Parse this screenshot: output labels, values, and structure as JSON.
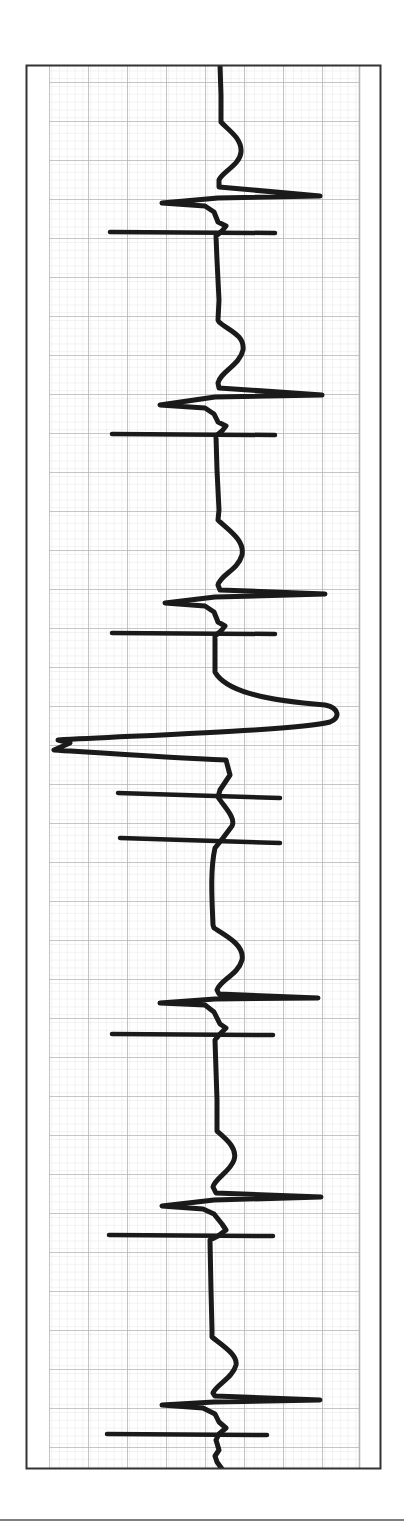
{
  "chart_data": {
    "type": "line",
    "title": "",
    "description": "Rhythm strip (rotated 90 degrees, time runs top to bottom) on ECG grid paper showing paced-style narrow complexes with pacing spike lines, and one wide ectopic complex",
    "orientation": "vertical-time",
    "xlabel": "",
    "ylabel": "",
    "grid": true,
    "grid_major_px": 39,
    "grid_minor_px": 7.8,
    "colors": {
      "trace": "#1a1a1a",
      "grid_major": "#b4b4b4",
      "grid_minor": "#dcdcdc",
      "frame": "#333333",
      "paper": "#ffffff"
    },
    "frame": {
      "x": 26,
      "y": 65,
      "width": 355,
      "height": 1404
    },
    "grid_area": {
      "x": 49,
      "y": 65,
      "width": 310,
      "height": 1404
    },
    "bottom_rule_y": 1520,
    "complexes": [
      {
        "index": 1,
        "kind": "narrow",
        "t_peak_y": 150,
        "r_y": 196,
        "r_x": 320,
        "s_y": 203,
        "s_x": 162,
        "spike_y": 232,
        "spike_x": [
          110,
          275
        ]
      },
      {
        "index": 2,
        "kind": "narrow",
        "t_peak_y": 347,
        "r_y": 395,
        "r_x": 322,
        "s_y": 405,
        "s_x": 160,
        "spike_y": 434,
        "spike_x": [
          112,
          275
        ]
      },
      {
        "index": 3,
        "kind": "narrow",
        "t_peak_y": 550,
        "r_y": 594,
        "r_x": 325,
        "s_y": 603,
        "s_x": 165,
        "spike_y": 633,
        "spike_x": [
          112,
          275
        ]
      },
      {
        "index": 4,
        "kind": "wide",
        "peak_y": 712,
        "peak_x": 336,
        "trough_y": 745,
        "trough_x": 54,
        "spikes": [
          {
            "y": 795,
            "x": [
              118,
              280
            ]
          },
          {
            "y": 840,
            "x": [
              120,
              280
            ]
          }
        ]
      },
      {
        "index": 5,
        "kind": "narrow",
        "t_peak_y": 955,
        "r_y": 998,
        "r_x": 318,
        "s_y": 1003,
        "s_x": 160,
        "spike_y": 1034,
        "spike_x": [
          112,
          273
        ]
      },
      {
        "index": 6,
        "kind": "narrow",
        "t_peak_y": 1150,
        "r_y": 1197,
        "r_x": 321,
        "s_y": 1206,
        "s_x": 162,
        "spike_y": 1235,
        "spike_x": [
          109,
          273
        ]
      },
      {
        "index": 7,
        "kind": "narrow",
        "t_peak_y": 1362,
        "r_y": 1400,
        "r_x": 320,
        "s_y": 1405,
        "s_x": 162,
        "spike_y": 1434,
        "spike_x": [
          107,
          267
        ]
      }
    ],
    "trace_path": "M220,65 L221,95 L221,122 C228,130 242,138 241,152 C240,165 222,172 219,180 L219,187 L320,196 L218,198 L162,203 L205,206 L214,212 L218,222 L226,226 L222,231 L216,236 L217,260 L219,300 L218,320 L219,322 C228,330 245,335 243,350 C240,365 220,372 218,383 L219,388 L322,395 L215,397 L160,405 L205,408 L214,414 L218,422 L226,426 L222,431 L216,436 L217,470 L219,510 L218,520 C228,530 245,540 242,555 C238,570 220,575 218,585 L220,590 L325,594 L215,597 L165,603 L205,606 L214,612 L218,622 L225,626 L221,631 L215,636 L215,660 L215,672 C225,690 260,700 325,705 C340,708 340,718 330,722 C300,730 150,735 58,740 L70,743 L54,750 C100,753 170,758 226,760 L230,775 L220,790 L218,797 C225,808 236,818 232,826 L223,838 L215,848 C210,870 212,900 213,925 L214,928 C225,935 245,945 242,960 C238,975 220,980 217,990 L219,994 L318,998 L215,999 L160,1003 L205,1005 L214,1012 L220,1024 L226,1028 L220,1034 L215,1040 L216,1070 L217,1100 L217,1131 C225,1138 238,1148 234,1160 C230,1172 215,1178 213,1187 L216,1193 L321,1197 L214,1200 L162,1206 L203,1209 L214,1214 L222,1224 L226,1230 L218,1236 L210,1240 L211,1290 L212,1330 L212,1337 C222,1345 238,1355 236,1365 C233,1378 216,1385 213,1393 L215,1396 L320,1400 L214,1402 L162,1405 L203,1408 L215,1414 L219,1422 L226,1428 L219,1434 L216,1440 L219,1450 L215,1456 L217,1462 L222,1469"
  }
}
